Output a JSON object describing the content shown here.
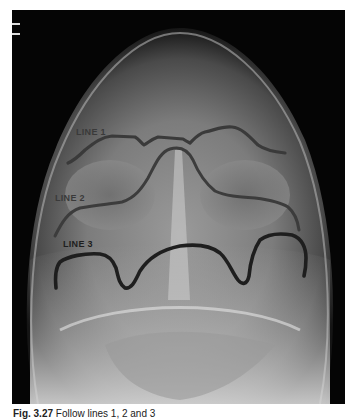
{
  "figure": {
    "labels": [
      {
        "text": "LINE 1",
        "color": "#3a3a3a"
      },
      {
        "text": "LINE 2",
        "color": "#3a3a3a"
      },
      {
        "text": "LINE 3",
        "color": "#1e1e1e"
      }
    ],
    "line_color": "#2a2a2a"
  },
  "caption": {
    "number": "Fig. 3.27",
    "text": "Follow lines 1, 2 and 3"
  }
}
